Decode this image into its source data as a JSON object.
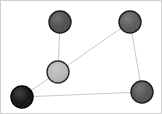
{
  "figure": {
    "kind": "node-link-graph",
    "background_color": "#ffffff",
    "border_color": "#cfcfcf",
    "width": 162,
    "height": 114
  },
  "chart_data": {
    "type": "scatter",
    "title": "",
    "subtitle": "",
    "xlabel": "",
    "ylabel": "",
    "grid": false,
    "legend": "none",
    "xlim": [
      0,
      162
    ],
    "ylim": [
      0,
      114
    ],
    "node_count": 5,
    "edge_count": 5,
    "nodes": [
      {
        "id": "n1",
        "label": "top-left-node",
        "x": 59,
        "y": 21,
        "r": 11,
        "fill": "#4a4a4a",
        "stroke": "#1c1c1c",
        "stroke_width": 1.4,
        "shade": "dark-gray"
      },
      {
        "id": "n2",
        "label": "top-right-node",
        "x": 129,
        "y": 21,
        "r": 11,
        "fill": "#565656",
        "stroke": "#1c1c1c",
        "stroke_width": 1.4,
        "shade": "dark-gray"
      },
      {
        "id": "n3",
        "label": "center-node",
        "x": 57,
        "y": 71,
        "r": 11,
        "fill": "#b6b6b6",
        "stroke": "#2a2a2a",
        "stroke_width": 1.4,
        "shade": "light-gray"
      },
      {
        "id": "n4",
        "label": "bottom-left-node",
        "x": 21,
        "y": 96,
        "r": 11,
        "fill": "#0d0d0d",
        "stroke": "#000000",
        "stroke_width": 1.4,
        "shade": "black"
      },
      {
        "id": "n5",
        "label": "bottom-right-node",
        "x": 141,
        "y": 91,
        "r": 11,
        "fill": "#4f4f4f",
        "stroke": "#1c1c1c",
        "stroke_width": 1.4,
        "shade": "medium-gray"
      }
    ],
    "edges": [
      {
        "id": "e1",
        "from": "n1",
        "to": "n3",
        "x1": 59,
        "y1": 21,
        "x2": 57,
        "y2": 71,
        "stroke": "#c9c9c9",
        "stroke_width": 1
      },
      {
        "id": "e2",
        "from": "n3",
        "to": "n2",
        "x1": 57,
        "y1": 71,
        "x2": 129,
        "y2": 21,
        "stroke": "#c9c9c9",
        "stroke_width": 1
      },
      {
        "id": "e3",
        "from": "n2",
        "to": "n5",
        "x1": 129,
        "y1": 21,
        "x2": 141,
        "y2": 91,
        "stroke": "#c9c9c9",
        "stroke_width": 1
      },
      {
        "id": "e4",
        "from": "n5",
        "to": "n4",
        "x1": 141,
        "y1": 91,
        "x2": 21,
        "y2": 96,
        "stroke": "#c9c9c9",
        "stroke_width": 1
      },
      {
        "id": "e5",
        "from": "n4",
        "to": "n3",
        "x1": 21,
        "y1": 96,
        "x2": 57,
        "y2": 71,
        "stroke": "#c9c9c9",
        "stroke_width": 1
      }
    ]
  }
}
